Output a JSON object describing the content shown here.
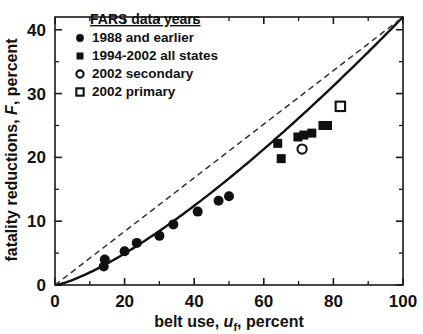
{
  "chart_data": {
    "type": "scatter",
    "title": "",
    "xlabel": "belt use, u_f, percent",
    "xlabel_parts": {
      "pre": "belt use, ",
      "sym": "u",
      "sub": "f",
      "post": ", percent"
    },
    "ylabel": "fatality reductions, F, percent",
    "ylabel_parts": {
      "pre": "fatality reductions, ",
      "sym": "F",
      "post": ", percent"
    },
    "xlim": [
      0,
      100
    ],
    "ylim": [
      0,
      42
    ],
    "xticks": [
      0,
      20,
      40,
      60,
      80,
      100
    ],
    "yticks": [
      0,
      10,
      20,
      30,
      40
    ],
    "xticklabels": [
      "0",
      "20",
      "40",
      "60",
      "80",
      "100"
    ],
    "yticklabels": [
      "0",
      "10",
      "20",
      "30",
      "40"
    ],
    "xminor_step": 10,
    "yminor_step": 5,
    "grid": false,
    "legend_position": "top-left",
    "legend_title": "FARS data years",
    "series": [
      {
        "name": "1988 and earlier",
        "marker": "filled-circle",
        "color": "#101010",
        "points": [
          {
            "x": 14.0,
            "y": 2.9
          },
          {
            "x": 14.3,
            "y": 4.0
          },
          {
            "x": 20.0,
            "y": 5.3
          },
          {
            "x": 23.5,
            "y": 6.6
          },
          {
            "x": 30.0,
            "y": 7.7
          },
          {
            "x": 34.0,
            "y": 9.5
          },
          {
            "x": 41.0,
            "y": 11.5
          },
          {
            "x": 47.0,
            "y": 13.2
          },
          {
            "x": 50.0,
            "y": 13.9
          }
        ]
      },
      {
        "name": "1994-2002 all states",
        "marker": "filled-square",
        "color": "#101010",
        "points": [
          {
            "x": 64.0,
            "y": 22.2
          },
          {
            "x": 65.0,
            "y": 19.8
          },
          {
            "x": 69.8,
            "y": 23.2
          },
          {
            "x": 71.5,
            "y": 23.5
          },
          {
            "x": 73.8,
            "y": 23.8
          },
          {
            "x": 77.0,
            "y": 25.0
          },
          {
            "x": 78.3,
            "y": 25.0
          }
        ]
      },
      {
        "name": "2002 secondary",
        "marker": "open-circle",
        "color": "#101010",
        "points": [
          {
            "x": 71.0,
            "y": 21.3
          }
        ]
      },
      {
        "name": "2002 primary",
        "marker": "open-square",
        "color": "#101010",
        "points": [
          {
            "x": 82.0,
            "y": 28.0
          }
        ]
      }
    ],
    "curves": [
      {
        "name": "model-fit",
        "style": "solid",
        "color": "#111111",
        "description": "power-law fit through origin to (100, 42)",
        "endpoint": {
          "x": 100,
          "y": 42
        },
        "exponent": 1.33
      },
      {
        "name": "linear-reference",
        "style": "dashed",
        "color": "#333333",
        "description": "straight proportional line from origin to (100, 42)",
        "endpoint": {
          "x": 100,
          "y": 42
        }
      }
    ],
    "annotations": []
  },
  "legend": {
    "title": "FARS data years",
    "entries": [
      {
        "marker": "filled-circle",
        "label": "1988 and earlier"
      },
      {
        "marker": "filled-square",
        "label": "1994-2002 all states"
      },
      {
        "marker": "open-circle",
        "label": "2002 secondary"
      },
      {
        "marker": "open-square",
        "label": "2002 primary"
      }
    ]
  }
}
